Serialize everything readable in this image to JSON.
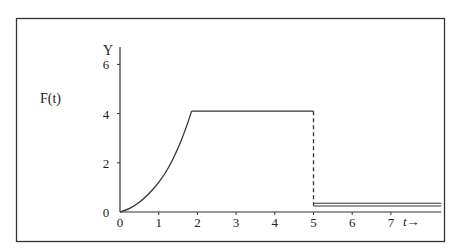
{
  "chart_data": {
    "type": "line",
    "title": "",
    "xlabel": "t→",
    "ylabel": "Y",
    "function_label": "F(t)",
    "xlim": [
      0,
      8.3
    ],
    "ylim": [
      0,
      7
    ],
    "x_ticks": [
      0,
      1,
      2,
      3,
      4,
      5,
      6,
      7
    ],
    "x_tick_labels": [
      "0",
      "1",
      "2",
      "3",
      "4",
      "5",
      "6",
      "7"
    ],
    "y_ticks": [
      0,
      2,
      4,
      6
    ],
    "y_tick_labels": [
      "0",
      "2",
      "4",
      "6"
    ],
    "grid": false,
    "legend": null,
    "series": [
      {
        "name": "F(t) rising curve",
        "style": "solid",
        "x": [
          0,
          0.25,
          0.5,
          0.75,
          1.0,
          1.25,
          1.5,
          1.7,
          1.85
        ],
        "y": [
          0,
          0.15,
          0.4,
          0.75,
          1.2,
          1.8,
          2.6,
          3.4,
          4.1
        ]
      },
      {
        "name": "F(t) plateau",
        "style": "solid",
        "x": [
          1.85,
          5.0
        ],
        "y": [
          4.1,
          4.1
        ]
      },
      {
        "name": "drop at t=5",
        "style": "dashed",
        "x": [
          5.0,
          5.0
        ],
        "y": [
          4.1,
          0.25
        ]
      },
      {
        "name": "F(t) after t=5 (double line)",
        "style": "double",
        "x": [
          5.0,
          8.3
        ],
        "y": [
          0.3,
          0.3
        ]
      }
    ]
  }
}
